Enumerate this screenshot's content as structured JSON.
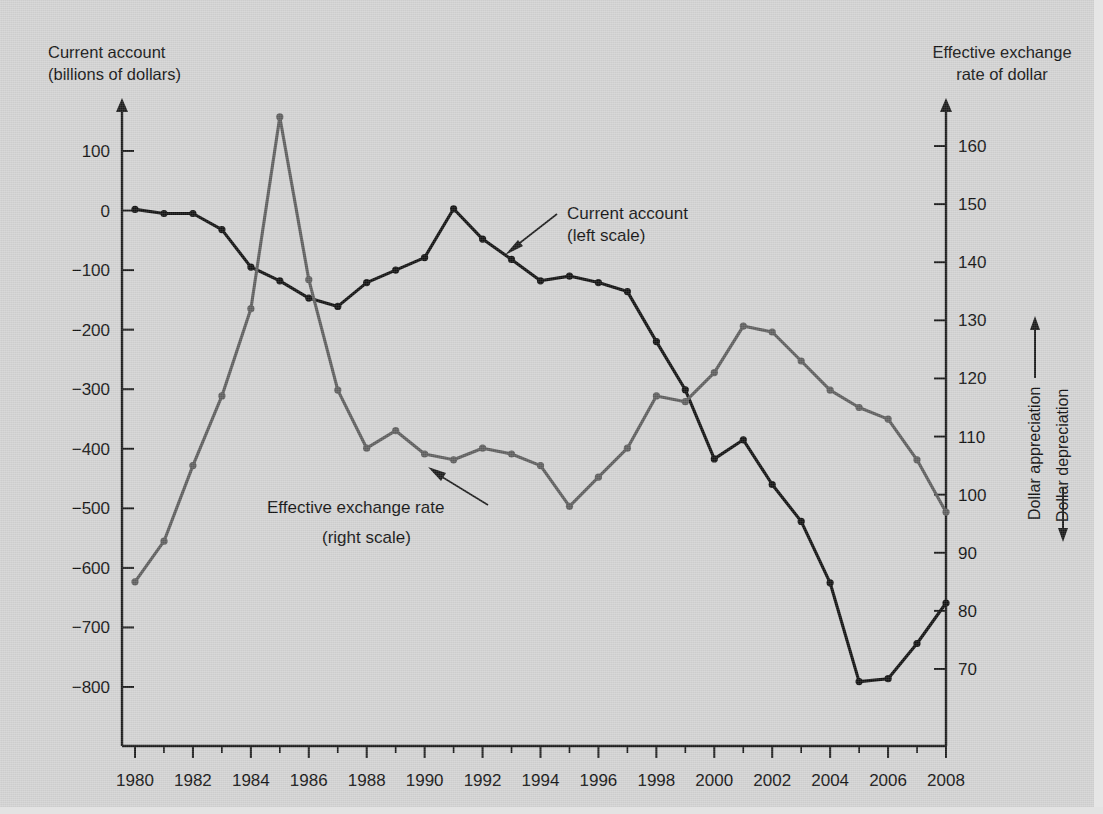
{
  "chart_data": {
    "type": "line",
    "title": "",
    "x": [
      1980,
      1981,
      1982,
      1983,
      1984,
      1985,
      1986,
      1987,
      1988,
      1989,
      1990,
      1991,
      1992,
      1993,
      1994,
      1995,
      1996,
      1997,
      1998,
      1999,
      2000,
      2001,
      2002,
      2003,
      2004,
      2005,
      2006,
      2007,
      2008
    ],
    "xlabel": "",
    "xlim": [
      1980,
      2008
    ],
    "xticks": [
      1980,
      1982,
      1984,
      1986,
      1988,
      1990,
      1992,
      1994,
      1996,
      1998,
      2000,
      2002,
      2004,
      2006,
      2008
    ],
    "xtick_labels": [
      "1980",
      "1982",
      "1984",
      "1986",
      "1988",
      "1990",
      "1992",
      "1994",
      "1996",
      "1998",
      "2000",
      "2002",
      "2004",
      "2006",
      "2008"
    ],
    "grid": false,
    "legend_position": "inline-annotations",
    "series": [
      {
        "name": "Current account",
        "axis": "left",
        "scale_note": "(left scale)",
        "units": "billions of dollars",
        "color": "#121212",
        "values": [
          2,
          -5,
          -5,
          -32,
          -95,
          -118,
          -147,
          -161,
          -121,
          -100,
          -79,
          3,
          -48,
          -82,
          -118,
          -110,
          -121,
          -136,
          -220,
          -301,
          -417,
          -385,
          -460,
          -522,
          -625,
          -791,
          -786,
          -727,
          -659
        ]
      },
      {
        "name": "Effective exchange rate",
        "axis": "right",
        "scale_note": "(right scale)",
        "units": "index",
        "color": "#5e5e5e",
        "values": [
          85,
          92,
          105,
          117,
          132,
          165,
          137,
          118,
          108,
          111,
          107,
          106,
          108,
          107,
          105,
          98,
          103,
          108,
          117,
          116,
          121,
          129,
          128,
          123,
          118,
          115,
          113,
          106,
          97
        ]
      }
    ],
    "left_axis": {
      "label_line1": "Current account",
      "label_line2": "(billions of dollars)",
      "ticks": [
        100,
        0,
        -100,
        -200,
        -300,
        -400,
        -500,
        -600,
        -700,
        -800
      ],
      "tick_labels": [
        "100",
        "0",
        "−100",
        "−200",
        "−300",
        "−400",
        "−500",
        "−600",
        "−700",
        "−800"
      ],
      "ylim": [
        -860,
        145
      ]
    },
    "right_axis": {
      "label_line1": "Effective exchange",
      "label_line2": "rate of dollar",
      "ticks": [
        160,
        150,
        140,
        130,
        120,
        110,
        100,
        90,
        80,
        70
      ],
      "tick_labels": [
        "160",
        "150",
        "140",
        "130",
        "120",
        "110",
        "100",
        "90",
        "80",
        "70"
      ],
      "ylim": [
        62,
        168
      ],
      "direction_up": "Dollar appreciation",
      "direction_down": "Dollar depreciation"
    },
    "annotations": [
      {
        "name": "current-account-callout",
        "line1": "Current account",
        "line2": "(left scale)"
      },
      {
        "name": "exchange-rate-callout",
        "line1": "Effective exchange rate",
        "line2": "(right scale)"
      }
    ]
  },
  "colors": {
    "background": "#d3d3d3",
    "current_account": "#121212",
    "exchange_rate": "#5e5e5e",
    "axis": "#1b1b1b",
    "text": "#111111"
  }
}
